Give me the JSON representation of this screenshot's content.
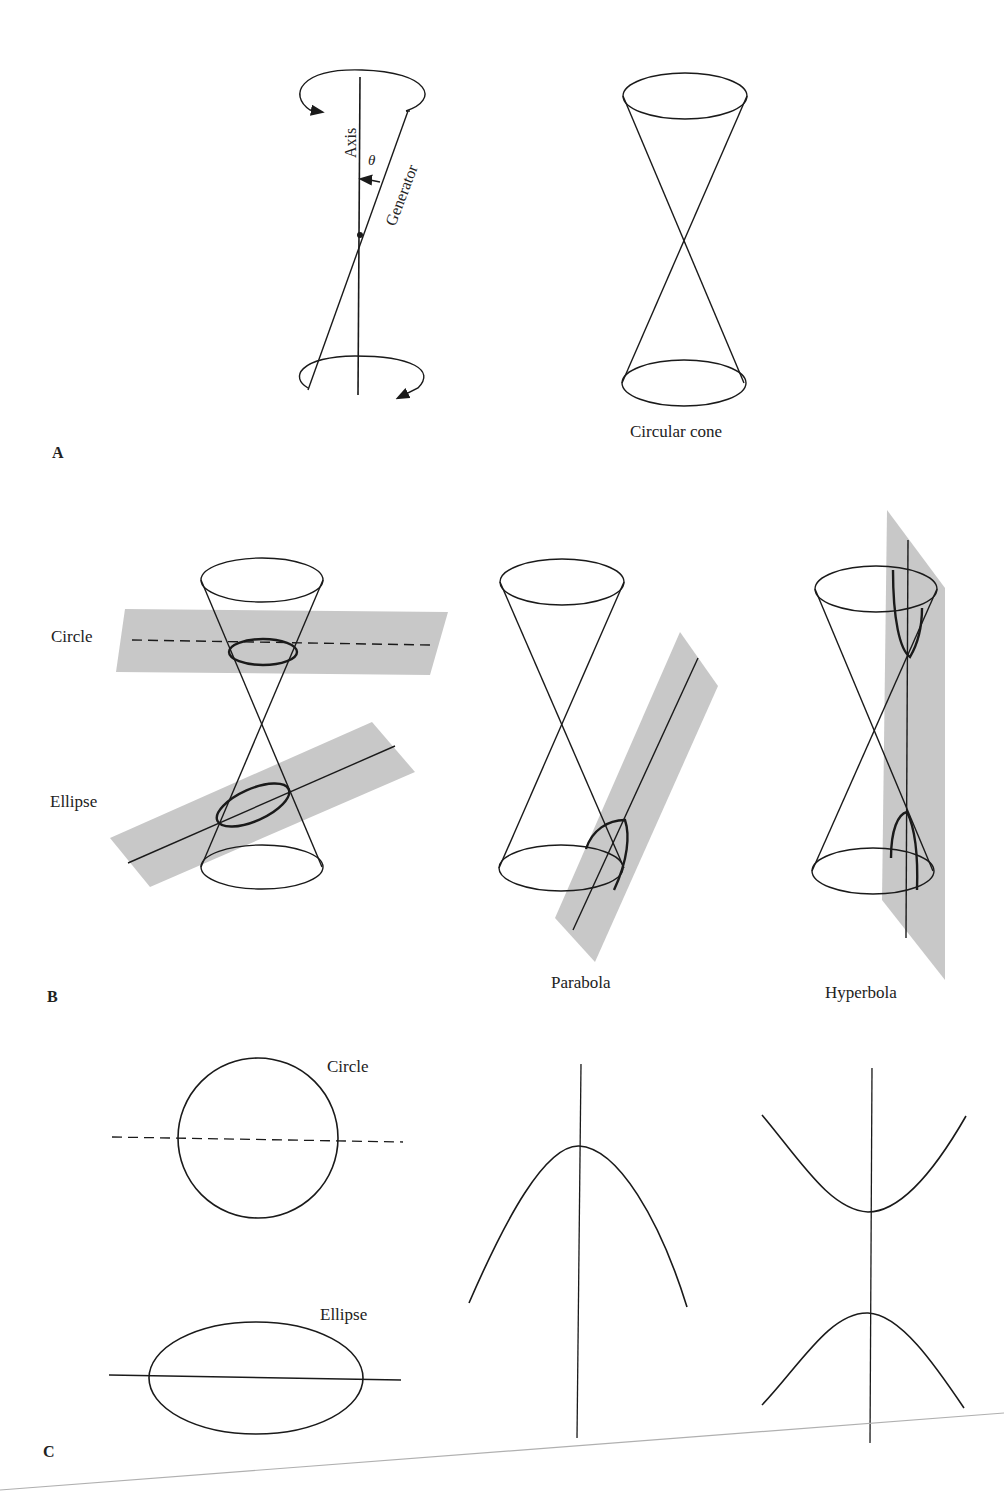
{
  "figure": {
    "panels": [
      {
        "id": "A",
        "letter": "A",
        "labels": {
          "axis": "Axis",
          "theta": "θ",
          "generator": "Generator",
          "circular_cone": "Circular cone"
        }
      },
      {
        "id": "B",
        "letter": "B",
        "labels": {
          "circle": "Circle",
          "ellipse": "Ellipse",
          "parabola": "Parabola",
          "hyperbola": "Hyperbola"
        }
      },
      {
        "id": "C",
        "letter": "C",
        "labels": {
          "circle": "Circle",
          "ellipse": "Ellipse"
        },
        "curves": [
          "circle",
          "ellipse",
          "parabola",
          "hyperbola"
        ]
      }
    ],
    "colors": {
      "ink": "#1a1a1a",
      "plane_fill": "#c8c8c8",
      "page_edge": "#b0b0b0",
      "background": "#ffffff"
    }
  }
}
